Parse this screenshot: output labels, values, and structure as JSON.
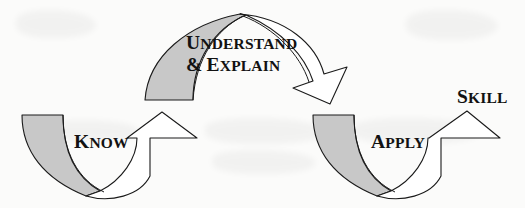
{
  "diagram": {
    "background_color": "#fbfbfa",
    "stroke_color": "#1a1a1a",
    "band_fill_gray": "#c8c8c8",
    "band_fill_white": "#ffffff",
    "stages": [
      {
        "id": "know",
        "label": "Know",
        "cap": "K",
        "rest": "now",
        "shape": "u-curve-arrow-up-right",
        "fill": "#c8c8c8"
      },
      {
        "id": "understand-explain",
        "label": "Understand & explain",
        "line1": {
          "cap": "U",
          "rest": "nderstand"
        },
        "line2": {
          "amp": "&",
          "cap": "E",
          "rest": "xplain"
        },
        "shape": "arch-arrow-down-right",
        "fill": "#c8c8c8"
      },
      {
        "id": "apply",
        "label": "Apply",
        "cap": "A",
        "rest": "pply",
        "shape": "u-curve-arrow-up-right",
        "fill": "#c8c8c8"
      },
      {
        "id": "skill",
        "label": "Skill",
        "cap": "S",
        "rest": "kill",
        "shape": "text-only",
        "fill": "none"
      }
    ]
  }
}
